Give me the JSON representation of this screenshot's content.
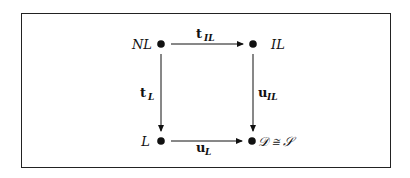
{
  "diagram": {
    "type": "commutative-diagram",
    "nodes": [
      {
        "id": "NL",
        "label": "NL",
        "position": "top-left"
      },
      {
        "id": "IL",
        "label": "IL",
        "position": "top-right"
      },
      {
        "id": "L",
        "label": "L",
        "position": "bottom-left"
      },
      {
        "id": "D",
        "label": "𝒟 ≅ 𝒮",
        "position": "bottom-right"
      }
    ],
    "edges": [
      {
        "from": "NL",
        "to": "IL",
        "label_main": "t",
        "label_sub": "IL"
      },
      {
        "from": "NL",
        "to": "L",
        "label_main": "t",
        "label_sub": "L"
      },
      {
        "from": "IL",
        "to": "D",
        "label_main": "u",
        "label_sub": "IL"
      },
      {
        "from": "L",
        "to": "D",
        "label_main": "u",
        "label_sub": "L"
      }
    ]
  }
}
